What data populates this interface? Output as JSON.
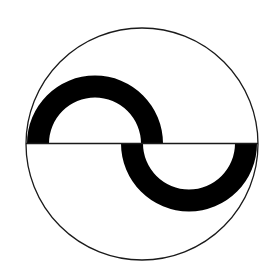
{
  "diagram": {
    "colors": {
      "background": "#ffffff",
      "stroke": "#1a1a1a",
      "band": "#000000"
    },
    "circle": {
      "cx": 142,
      "cy": 144,
      "r": 116
    },
    "axis": {
      "x1": 26,
      "x2": 258,
      "y": 143.5
    },
    "upper_band": {
      "cx": 95,
      "cy": 143.5,
      "outer_r": 68,
      "inner_r": 46
    },
    "lower_band": {
      "cx": 189,
      "cy": 143.5,
      "outer_r": 68,
      "inner_r": 46
    }
  }
}
